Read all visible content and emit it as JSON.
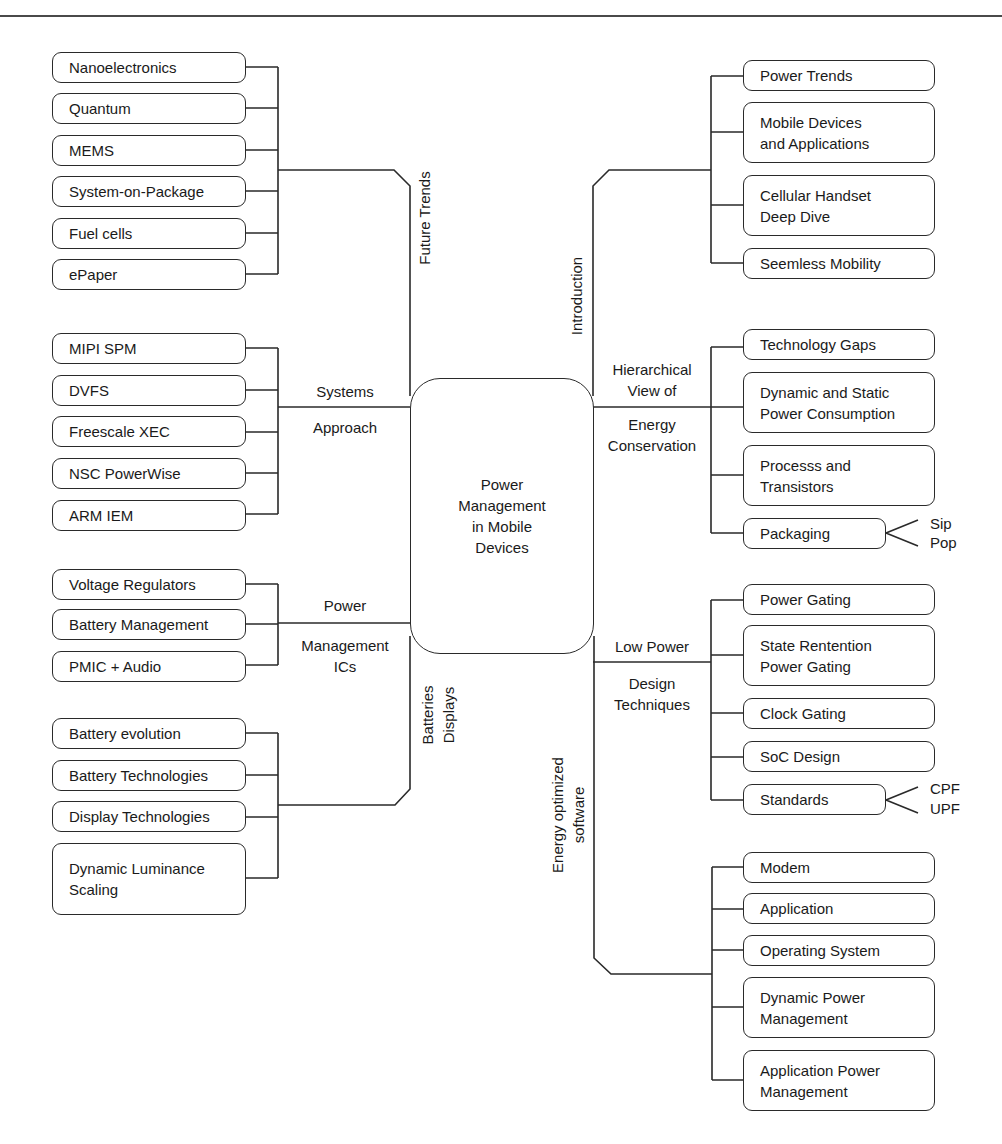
{
  "center": {
    "label": "Power\nManagement\nin Mobile\nDevices"
  },
  "branches": {
    "future_trends": {
      "label": "Future Trends",
      "items": [
        "Nanoelectronics",
        "Quantum",
        "MEMS",
        "System-on-Package",
        "Fuel cells",
        "ePaper"
      ]
    },
    "systems_approach": {
      "label_top": "Systems",
      "label_bottom": "Approach",
      "items": [
        "MIPI SPM",
        "DVFS",
        "Freescale XEC",
        "NSC PowerWise",
        "ARM IEM"
      ]
    },
    "power_management_ics": {
      "label_top": "Power",
      "label_bottom": "Management\nICs",
      "items": [
        "Voltage Regulators",
        "Battery Management",
        "PMIC + Audio"
      ]
    },
    "batteries_displays": {
      "label": "Batteries\nDisplays",
      "items": [
        "Battery evolution",
        "Battery Technologies",
        "Display Technologies",
        "Dynamic Luminance\nScaling"
      ]
    },
    "introduction": {
      "label": "Introduction",
      "items": [
        "Power Trends",
        "Mobile Devices\nand Applications",
        "Cellular Handset\nDeep Dive",
        "Seemless Mobility"
      ]
    },
    "hierarchical_view": {
      "label_top": "Hierarchical\nView of",
      "label_bottom": "Energy\nConservation",
      "items": [
        "Technology Gaps",
        "Dynamic and Static\nPower Consumption",
        "Processs and\nTransistors",
        "Packaging"
      ],
      "packaging_leaves": [
        "Sip",
        "Pop"
      ]
    },
    "low_power_design": {
      "label_top": "Low Power",
      "label_bottom": "Design\nTechniques",
      "items": [
        "Power Gating",
        "State Rentention\nPower Gating",
        "Clock Gating",
        "SoC Design",
        "Standards"
      ],
      "standards_leaves": [
        "CPF",
        "UPF"
      ]
    },
    "energy_optimized_software": {
      "label": "Energy optimized\nsoftware",
      "items": [
        "Modem",
        "Application",
        "Operating System",
        "Dynamic Power\nManagement",
        "Application Power\nManagement"
      ]
    }
  },
  "colors": {
    "line": "#2a2a2a",
    "background": "#ffffff",
    "text": "#1a1a1a"
  }
}
